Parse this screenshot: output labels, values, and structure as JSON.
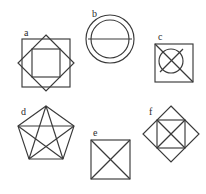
{
  "page": {
    "background_color": "#ffffff",
    "stroke_color": "#3a3a3a",
    "label_color": "#2b2b2b"
  },
  "figures": [
    {
      "key": "a",
      "label": "a",
      "description": "Square with inscribed rotated square (diamond) and an inner upright square",
      "shapes": [
        "outer-square",
        "diamond",
        "inner-square"
      ]
    },
    {
      "key": "b",
      "label": "b",
      "description": "Two concentric circles with a horizontal diameter line across the inner circle",
      "shapes": [
        "outer-circle",
        "inner-circle",
        "horizontal-diameter"
      ]
    },
    {
      "key": "c",
      "label": "c",
      "description": "Square containing a circle crossed by two diagonals, the main diagonal spanning the full square",
      "shapes": [
        "square",
        "circle",
        "diagonal-main",
        "diagonal-secondary"
      ]
    },
    {
      "key": "d",
      "label": "d",
      "description": "Regular pentagon with all five diagonals drawn forming an inner pentagram",
      "shapes": [
        "pentagon",
        "pentagram-diagonals"
      ]
    },
    {
      "key": "e",
      "label": "e",
      "description": "Square with both diagonals drawn",
      "shapes": [
        "square",
        "diagonal-1",
        "diagonal-2"
      ]
    },
    {
      "key": "f",
      "label": "f",
      "description": "Rotated square (diamond) with an inscribed upright square containing both diagonals",
      "shapes": [
        "diamond",
        "inner-square",
        "diagonal-1",
        "diagonal-2"
      ]
    }
  ]
}
